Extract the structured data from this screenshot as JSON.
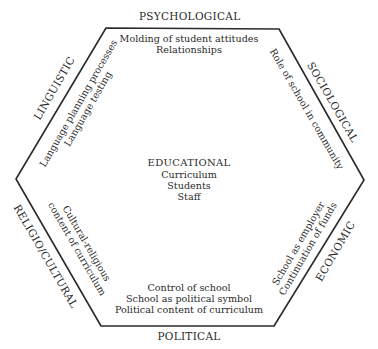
{
  "diagram": {
    "center": {
      "title": "EDUCATIONAL",
      "items": [
        "Curriculum",
        "Students",
        "Staff"
      ]
    },
    "dimensions": [
      {
        "id": "psychological",
        "label": "PSYCHOLOGICAL",
        "items": [
          "Molding of student attitudes",
          "Relationships"
        ]
      },
      {
        "id": "sociological",
        "label": "SOCIOLOGICAL",
        "items": [
          "Role of school in community"
        ]
      },
      {
        "id": "economic",
        "label": "ECONOMIC",
        "items": [
          "School as employer",
          "Continuation of funds"
        ]
      },
      {
        "id": "political",
        "label": "POLITICAL",
        "items": [
          "Control of school",
          "School as political symbol",
          "Political content of curriculum"
        ]
      },
      {
        "id": "religio-cultural",
        "label": "RELIGIO/CULTURAL",
        "items": [
          "Cultural-religious",
          "content of curriculum"
        ]
      },
      {
        "id": "linguistic",
        "label": "LINGUISTIC",
        "items": [
          "Language planning processes",
          "Language testing"
        ]
      }
    ]
  }
}
